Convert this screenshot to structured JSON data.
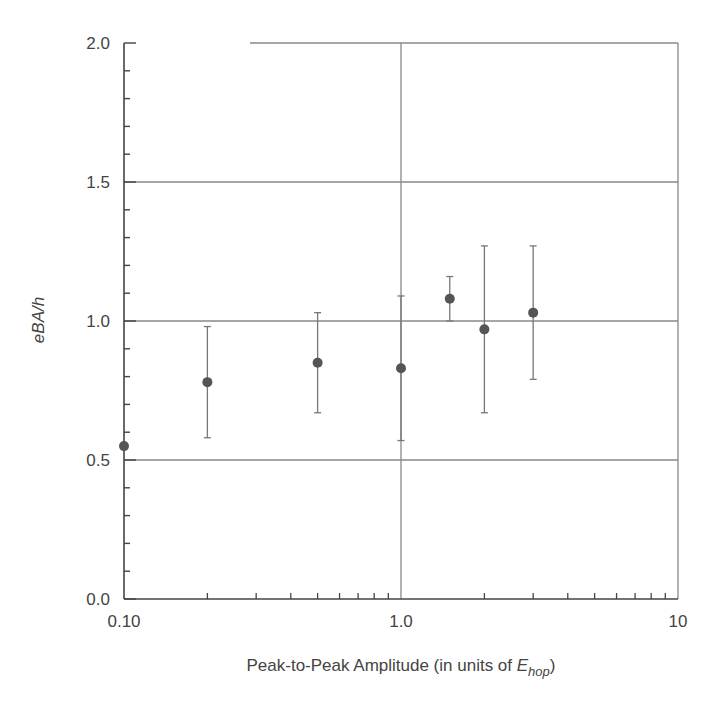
{
  "chart_data": {
    "type": "scatter",
    "title": "",
    "xlabel": "Peak-to-Peak Amplitude (in units of E_hop)",
    "xlabel_parts": {
      "main": "Peak-to-Peak Amplitude (in units of ",
      "italic": "E",
      "sub": "hop",
      "close": ")"
    },
    "ylabel": "eBA/h",
    "xscale": "log",
    "xlim": [
      0.1,
      10
    ],
    "ylim": [
      0.0,
      2.0
    ],
    "x_ticks": [
      {
        "value": 0.1,
        "label": "0.10"
      },
      {
        "value": 1.0,
        "label": "1.0"
      },
      {
        "value": 10,
        "label": "10"
      }
    ],
    "y_ticks": [
      {
        "value": 0.0,
        "label": "0.0"
      },
      {
        "value": 0.5,
        "label": "0.5"
      },
      {
        "value": 1.0,
        "label": "1.0"
      },
      {
        "value": 1.5,
        "label": "1.5"
      },
      {
        "value": 2.0,
        "label": "2.0"
      }
    ],
    "y_minor_step": 0.1,
    "grid": {
      "horizontal": [
        0.5,
        1.0,
        1.5,
        2.0
      ],
      "vertical": [
        1.0,
        10
      ]
    },
    "legend": null,
    "series": [
      {
        "name": "eBA/h",
        "marker": "circle",
        "color": "#555555",
        "points": [
          {
            "x": 0.1,
            "y": 0.55,
            "err_low": null,
            "err_high": null
          },
          {
            "x": 0.2,
            "y": 0.78,
            "err_low": 0.58,
            "err_high": 0.98
          },
          {
            "x": 0.5,
            "y": 0.85,
            "err_low": 0.67,
            "err_high": 1.03
          },
          {
            "x": 1.0,
            "y": 0.83,
            "err_low": 0.57,
            "err_high": 1.09
          },
          {
            "x": 1.5,
            "y": 1.08,
            "err_low": 1.0,
            "err_high": 1.16
          },
          {
            "x": 2.0,
            "y": 0.97,
            "err_low": 0.67,
            "err_high": 1.27
          },
          {
            "x": 3.0,
            "y": 1.03,
            "err_low": 0.79,
            "err_high": 1.27
          }
        ]
      }
    ]
  },
  "colors": {
    "axis": "#444444",
    "grid": "#888888",
    "marker": "#555555",
    "errorbar": "#777777"
  }
}
